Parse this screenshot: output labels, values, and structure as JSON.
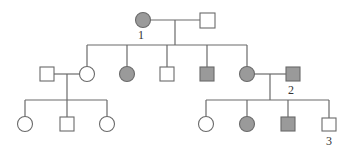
{
  "diagram": {
    "type": "pedigree",
    "colors": {
      "affected_fill": "#9a9a9a",
      "unaffected_fill": "#ffffff",
      "stroke": "#6a6a6a"
    },
    "legend_labels": {
      "individual_1": "1",
      "individual_2": "2",
      "individual_3": "3"
    },
    "generations": [
      {
        "name": "I",
        "individuals": [
          {
            "sex": "female",
            "affected": true,
            "label": "1"
          },
          {
            "sex": "male",
            "affected": false,
            "label": ""
          }
        ]
      },
      {
        "name": "II",
        "individuals": [
          {
            "sex": "male",
            "affected": false,
            "label": "",
            "note": "married-in spouse"
          },
          {
            "sex": "female",
            "affected": false,
            "label": ""
          },
          {
            "sex": "female",
            "affected": true,
            "label": ""
          },
          {
            "sex": "male",
            "affected": false,
            "label": ""
          },
          {
            "sex": "male",
            "affected": true,
            "label": ""
          },
          {
            "sex": "female",
            "affected": true,
            "label": ""
          },
          {
            "sex": "male",
            "affected": true,
            "label": "2",
            "note": "married-in spouse"
          }
        ]
      },
      {
        "name": "III",
        "individuals": [
          {
            "sex": "female",
            "affected": false,
            "label": ""
          },
          {
            "sex": "male",
            "affected": false,
            "label": ""
          },
          {
            "sex": "female",
            "affected": false,
            "label": ""
          },
          {
            "sex": "female",
            "affected": false,
            "label": ""
          },
          {
            "sex": "female",
            "affected": true,
            "label": ""
          },
          {
            "sex": "male",
            "affected": true,
            "label": ""
          },
          {
            "sex": "male",
            "affected": false,
            "label": "3"
          }
        ]
      }
    ]
  }
}
